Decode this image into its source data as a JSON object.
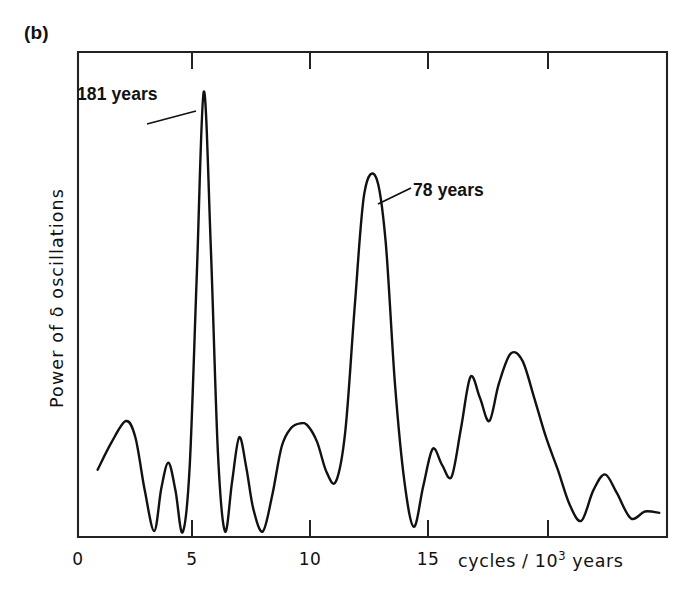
{
  "figure": {
    "panel_label": "(b)",
    "background_color": "#ffffff",
    "line_color": "#111111",
    "axis_color": "#222222"
  },
  "annotations": [
    {
      "id": "peak-181",
      "text": "181 years",
      "x_cycles": 5.5
    },
    {
      "id": "peak-78",
      "text": "78 years",
      "x_cycles": 12.8
    }
  ],
  "axes": {
    "x_title_main": "cycles / 10",
    "x_title_exponent": "3",
    "x_title_unit": " years",
    "y_title": "Power of δ oscillations",
    "x_tick_labels": [
      "0",
      "5",
      "10",
      "15"
    ]
  },
  "chart_data": {
    "type": "line",
    "title": "",
    "subtitle": "",
    "xlabel": "cycles / 10^3 years",
    "ylabel": "Power of δ oscillations",
    "xlim": [
      0,
      24.8
    ],
    "ylim": [
      0,
      1.0
    ],
    "grid": false,
    "legend": "none",
    "panel": "(b)",
    "annotations": [
      {
        "label": "181 years",
        "x": 5.5,
        "y": 0.96,
        "note": "tallest peak"
      },
      {
        "label": "78 years",
        "x": 12.8,
        "y": 0.77,
        "note": "second tallest peak"
      }
    ],
    "x_ticks": [
      0,
      5,
      10,
      15,
      20
    ],
    "x_tick_labels_shown": [
      "0",
      "5",
      "10",
      "15"
    ],
    "y_ticks": [],
    "series": [
      {
        "name": "Power of delta oscillations",
        "x": [
          1.0,
          1.6,
          2.2,
          2.6,
          3.0,
          3.4,
          3.7,
          4.0,
          4.3,
          4.6,
          4.9,
          5.2,
          5.5,
          5.8,
          6.1,
          6.4,
          6.7,
          7.0,
          7.3,
          7.6,
          8.0,
          8.4,
          8.8,
          9.2,
          9.6,
          9.9,
          10.3,
          10.7,
          11.1,
          11.5,
          11.9,
          12.3,
          12.8,
          13.2,
          13.6,
          14.0,
          14.4,
          14.8,
          15.2,
          15.6,
          16.0,
          16.4,
          16.8,
          17.2,
          17.6,
          18.0,
          18.5,
          19.0,
          19.5,
          20.0,
          20.5,
          21.0,
          21.5,
          22.0,
          22.5,
          23.0,
          23.6,
          24.2,
          24.8
        ],
        "y": [
          0.145,
          0.205,
          0.25,
          0.215,
          0.1,
          0.013,
          0.105,
          0.16,
          0.1,
          0.01,
          0.15,
          0.56,
          0.96,
          0.62,
          0.18,
          0.012,
          0.12,
          0.215,
          0.15,
          0.06,
          0.012,
          0.09,
          0.195,
          0.235,
          0.245,
          0.24,
          0.205,
          0.14,
          0.12,
          0.23,
          0.5,
          0.74,
          0.775,
          0.64,
          0.33,
          0.12,
          0.022,
          0.11,
          0.19,
          0.155,
          0.13,
          0.235,
          0.345,
          0.3,
          0.25,
          0.33,
          0.395,
          0.38,
          0.3,
          0.215,
          0.145,
          0.07,
          0.035,
          0.1,
          0.135,
          0.095,
          0.04,
          0.055,
          0.052
        ]
      }
    ]
  }
}
